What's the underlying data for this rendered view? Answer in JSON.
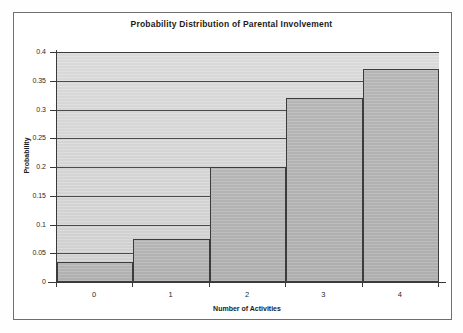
{
  "figure": {
    "title": "Probability Distribution of Parental Involvement"
  },
  "chart_data": {
    "type": "bar",
    "title": "Probability Distribution of Parental Involvement",
    "xlabel": "Number of Activities",
    "ylabel": "Probability",
    "categories": [
      "0",
      "1",
      "2",
      "3",
      "4"
    ],
    "values": [
      0.035,
      0.075,
      0.2,
      0.32,
      0.37
    ],
    "ylim": [
      0,
      0.4
    ],
    "ytick_labels": [
      "0.4",
      "0.35",
      "0.3",
      "0.25",
      "0.2",
      "0.15",
      "0.1",
      "0.05",
      "0"
    ],
    "ytick_values": [
      0.4,
      0.35,
      0.3,
      0.25,
      0.2,
      0.15,
      0.1,
      0.05,
      0
    ],
    "grid": true,
    "legend": false,
    "bar_style": "adjacent-histogram",
    "colors": {
      "bar_fill": "#b5b5b5",
      "bar_edge": "#3c3c3c",
      "plot_background": "#d7d7d7",
      "gridline": "#4a4a4a",
      "axis": "#3a3a3a",
      "text": "#1b1b1b"
    }
  }
}
